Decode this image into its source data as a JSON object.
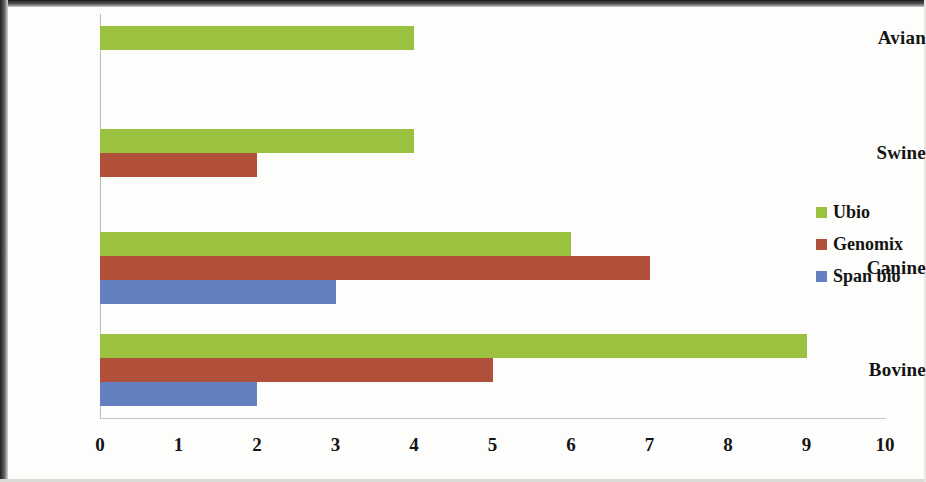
{
  "chart_data": {
    "type": "bar",
    "orientation": "horizontal",
    "title": "",
    "xlabel": "",
    "ylabel": "",
    "categories": [
      "Avian",
      "Swine",
      "Canine",
      "Bovine"
    ],
    "series": [
      {
        "name": "Ubio",
        "color": "#9ac23f",
        "values": [
          4,
          4,
          6,
          9
        ]
      },
      {
        "name": "Genomix",
        "color": "#b0503a",
        "values": [
          null,
          2,
          7,
          5
        ]
      },
      {
        "name": "Span bio",
        "color": "#6480c0",
        "values": [
          null,
          null,
          3,
          2
        ]
      }
    ],
    "xlim": [
      0,
      10
    ],
    "xticks": [
      "0",
      "1",
      "2",
      "3",
      "4",
      "5",
      "6",
      "7",
      "8",
      "9",
      "10"
    ],
    "grid": false,
    "legend_position": "right",
    "legend_entries": [
      "Ubio",
      "Genomix",
      "Span bio"
    ],
    "background": "#fdfdfb",
    "axis_color": "#b9bcb8"
  }
}
